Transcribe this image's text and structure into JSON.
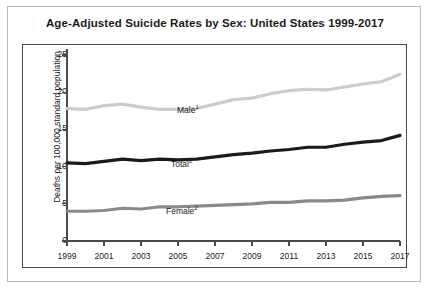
{
  "figure": {
    "title": "Age-Adjusted Suicide Rates by Sex: United States 1999-2017"
  },
  "chart_data": {
    "type": "line",
    "title": "Age-Adjusted Suicide Rates by Sex: United States 1999-2017",
    "xlabel": "",
    "ylabel": "Deaths per 100,000 standard population",
    "xlim": [
      1999,
      2017
    ],
    "ylim": [
      0,
      25
    ],
    "yticks": [
      0,
      5,
      10,
      15,
      20,
      25
    ],
    "xticks": [
      1999,
      2001,
      2003,
      2005,
      2007,
      2009,
      2011,
      2013,
      2015,
      2017
    ],
    "xtick_labels": [
      "1999",
      "2001",
      "2003",
      "2005",
      "2007",
      "2009",
      "2011",
      "2013",
      "2015",
      "2017"
    ],
    "ytick_labels": [
      "0",
      "5",
      "10",
      "15",
      "20",
      "25"
    ],
    "grid": false,
    "legend_position": "inline-labels",
    "x": [
      1999,
      2000,
      2001,
      2002,
      2003,
      2004,
      2005,
      2006,
      2007,
      2008,
      2009,
      2010,
      2011,
      2012,
      2013,
      2014,
      2015,
      2016,
      2017
    ],
    "series": [
      {
        "name": "Male",
        "footnote": "1",
        "label": "Male",
        "color": "#cccccc",
        "values": [
          17.8,
          17.7,
          18.2,
          18.4,
          18.0,
          17.7,
          17.7,
          17.8,
          18.4,
          19.0,
          19.2,
          19.8,
          20.2,
          20.4,
          20.3,
          20.7,
          21.1,
          21.4,
          22.4
        ]
      },
      {
        "name": "Total",
        "footnote": "2",
        "label": "Total",
        "color": "#1a1a1a",
        "values": [
          10.5,
          10.4,
          10.7,
          11.0,
          10.8,
          11.0,
          10.9,
          11.0,
          11.3,
          11.6,
          11.8,
          12.1,
          12.3,
          12.6,
          12.6,
          13.0,
          13.3,
          13.5,
          14.2
        ]
      },
      {
        "name": "Female",
        "footnote": "2",
        "label": "Female",
        "color": "#8a8a8a",
        "values": [
          4.0,
          4.0,
          4.1,
          4.4,
          4.3,
          4.6,
          4.6,
          4.7,
          4.8,
          4.9,
          5.0,
          5.2,
          5.2,
          5.4,
          5.4,
          5.5,
          5.8,
          6.0,
          6.1
        ]
      }
    ],
    "series_label_positions": [
      {
        "name": "Male",
        "left": 154,
        "top": 59
      },
      {
        "name": "Total",
        "left": 148,
        "top": 113
      },
      {
        "name": "Female",
        "left": 143,
        "top": 160
      }
    ],
    "colors": {
      "male": "#cccccc",
      "total": "#1a1a1a",
      "female": "#8a8a8a",
      "axis": "#4a4a4a",
      "card_border": "#b9b9b9",
      "text": "#1b1b1b"
    }
  }
}
